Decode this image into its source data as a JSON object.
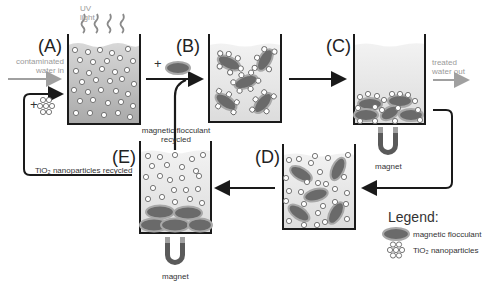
{
  "diagram": {
    "type": "process-flow",
    "stages": [
      {
        "id": "A",
        "label": "(A)",
        "description": "contaminated water with TiO2 nanoparticles under UV light"
      },
      {
        "id": "B",
        "label": "(B)",
        "description": "magnetic flocculant added, nanoparticles attach"
      },
      {
        "id": "C",
        "label": "(C)",
        "description": "flocs settled by magnet, treated water out"
      },
      {
        "id": "D",
        "label": "(D)",
        "description": "flocculant and nanoparticles separated"
      },
      {
        "id": "E",
        "label": "(E)",
        "description": "magnet retains flocculant, nanoparticles recycled"
      }
    ],
    "annotations": {
      "uv_light": [
        "UV",
        "light"
      ],
      "contaminated_in": [
        "contaminated",
        "water in"
      ],
      "treated_out": [
        "treated",
        "water out"
      ],
      "flocculant_recycled": [
        "magnetic flocculant",
        "recycled"
      ],
      "tio2_recycled": "TiO₂ nanoparticles recycled",
      "magnet": "magnet",
      "plus": "+"
    },
    "legend": {
      "title": "Legend:",
      "items": [
        {
          "icon": "flocculant-ellipse-icon",
          "label": "magnetic flocculant"
        },
        {
          "icon": "nanoparticle-cluster-icon",
          "label": "TiO₂ nanoparticles"
        }
      ]
    },
    "colors": {
      "line": "#1a1a1a",
      "water_fill": "#e6e6e6",
      "water_dark": "#b8b8b8",
      "flocculant": "#6a6a6a",
      "flocculant_halo": "#a8a8a8",
      "magnet": "#5a5a5a",
      "magnet_tip": "#a0a0a0",
      "gray_arrow": "#a0a0a0"
    }
  }
}
